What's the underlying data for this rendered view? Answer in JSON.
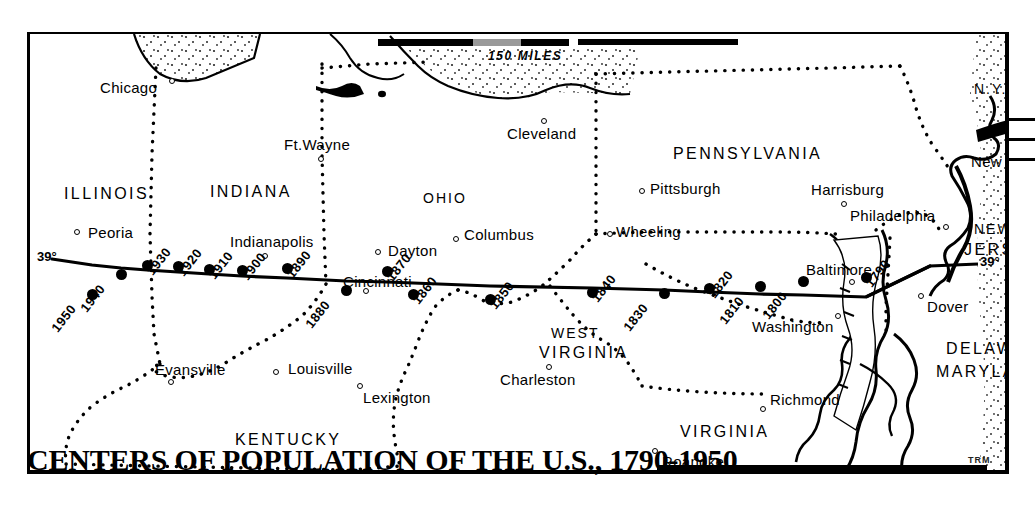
{
  "title": {
    "text": "CENTERS OF POPULATION OF THE U.S., 1790-1950",
    "signature": "TRM"
  },
  "scale": {
    "label": "150 MILES"
  },
  "latitude": {
    "left_label": "39°",
    "right_label": "39°"
  },
  "states": [
    {
      "name": "ILLINOIS",
      "x": 34,
      "y": 152
    },
    {
      "name": "INDIANA",
      "x": 180,
      "y": 150
    },
    {
      "name": "OHIO",
      "x": 393,
      "y": 157
    },
    {
      "name": "PENNSYLVANIA",
      "x": 643,
      "y": 112
    },
    {
      "name": "N.Y.",
      "x": 944,
      "y": 48
    },
    {
      "name": "NEW",
      "x": 944,
      "y": 188
    },
    {
      "name": "JERSEY",
      "x": 934,
      "y": 208
    },
    {
      "name": "WEST",
      "x": 521,
      "y": 292
    },
    {
      "name": "VIRGINIA",
      "x": 509,
      "y": 311
    },
    {
      "name": "KENTUCKY",
      "x": 205,
      "y": 398
    },
    {
      "name": "VIRGINIA",
      "x": 650,
      "y": 390
    },
    {
      "name": "DELAWARE",
      "x": 916,
      "y": 307
    },
    {
      "name": "MARYLAND",
      "x": 906,
      "y": 330
    }
  ],
  "cities": [
    {
      "name": "Chicago",
      "label_x": 70,
      "label_y": 46,
      "dot_x": 139,
      "dot_y": 44
    },
    {
      "name": "Ft.Wayne",
      "label_x": 254,
      "label_y": 103,
      "dot_x": 288,
      "dot_y": 122
    },
    {
      "name": "Cleveland",
      "label_x": 477,
      "label_y": 92,
      "dot_x": 511,
      "dot_y": 84
    },
    {
      "name": "Peoria",
      "label_x": 58,
      "label_y": 191,
      "dot_x": 44,
      "dot_y": 195
    },
    {
      "name": "Indianapolis",
      "label_x": 200,
      "label_y": 200,
      "dot_x": 232,
      "dot_y": 219
    },
    {
      "name": "Dayton",
      "label_x": 358,
      "label_y": 209,
      "dot_x": 345,
      "dot_y": 215
    },
    {
      "name": "Columbus",
      "label_x": 434,
      "label_y": 193,
      "dot_x": 423,
      "dot_y": 202
    },
    {
      "name": "Pittsburgh",
      "label_x": 620,
      "label_y": 147,
      "dot_x": 609,
      "dot_y": 154
    },
    {
      "name": "Harrisburg",
      "label_x": 781,
      "label_y": 148,
      "dot_x": 811,
      "dot_y": 167
    },
    {
      "name": "Philadelphia",
      "label_x": 820,
      "label_y": 174,
      "dot_x": 913,
      "dot_y": 190
    },
    {
      "name": "New York",
      "label_x": 941,
      "label_y": 120,
      "dot_x": 1001,
      "dot_y": 122
    },
    {
      "name": "Wheeling",
      "label_x": 586,
      "label_y": 190,
      "dot_x": 577,
      "dot_y": 197
    },
    {
      "name": "Cincinnati",
      "label_x": 313,
      "label_y": 240,
      "dot_x": 333,
      "dot_y": 254
    },
    {
      "name": "Baltimore",
      "label_x": 776,
      "label_y": 228,
      "dot_x": 819,
      "dot_y": 245
    },
    {
      "name": "Washington",
      "label_x": 722,
      "label_y": 285,
      "dot_x": 805,
      "dot_y": 279
    },
    {
      "name": "Dover",
      "label_x": 897,
      "label_y": 265,
      "dot_x": 888,
      "dot_y": 259
    },
    {
      "name": "Evansville",
      "label_x": 125,
      "label_y": 328,
      "dot_x": 138,
      "dot_y": 345
    },
    {
      "name": "Louisville",
      "label_x": 258,
      "label_y": 327,
      "dot_x": 243,
      "dot_y": 335
    },
    {
      "name": "Lexington",
      "label_x": 333,
      "label_y": 356,
      "dot_x": 327,
      "dot_y": 349
    },
    {
      "name": "Charleston",
      "label_x": 470,
      "label_y": 338,
      "dot_x": 516,
      "dot_y": 330
    },
    {
      "name": "Richmond",
      "label_x": 740,
      "label_y": 358,
      "dot_x": 730,
      "dot_y": 372
    },
    {
      "name": "Roanoke",
      "label_x": 632,
      "label_y": 420,
      "dot_x": 622,
      "dot_y": 414
    }
  ],
  "chart_data": {
    "type": "scatter",
    "title": "CENTERS OF POPULATION OF THE U.S., 1790-1950",
    "xlabel": "",
    "ylabel": "",
    "note": "Geographic center of U.S. population plotted by census year; migrates westward along approximately 39 degrees north latitude.",
    "series": [
      {
        "name": "Center of population",
        "points": [
          {
            "year": "1790",
            "x": 836,
            "y": 243
          },
          {
            "year": "1800",
            "x": 773,
            "y": 247
          },
          {
            "year": "1810",
            "x": 730,
            "y": 252
          },
          {
            "year": "1820",
            "x": 679,
            "y": 254
          },
          {
            "year": "1830",
            "x": 634,
            "y": 259
          },
          {
            "year": "1840",
            "x": 562,
            "y": 258
          },
          {
            "year": "1850",
            "x": 460,
            "y": 265
          },
          {
            "year": "1860",
            "x": 383,
            "y": 260
          },
          {
            "year": "1870",
            "x": 357,
            "y": 237
          },
          {
            "year": "1880",
            "x": 316,
            "y": 256
          },
          {
            "year": "1890",
            "x": 257,
            "y": 234
          },
          {
            "year": "1900",
            "x": 212,
            "y": 236
          },
          {
            "year": "1910",
            "x": 179,
            "y": 235
          },
          {
            "year": "1920",
            "x": 148,
            "y": 232
          },
          {
            "year": "1930",
            "x": 117,
            "y": 231
          },
          {
            "year": "1940",
            "x": 91,
            "y": 240
          },
          {
            "year": "1950",
            "x": 62,
            "y": 260
          }
        ]
      }
    ]
  }
}
